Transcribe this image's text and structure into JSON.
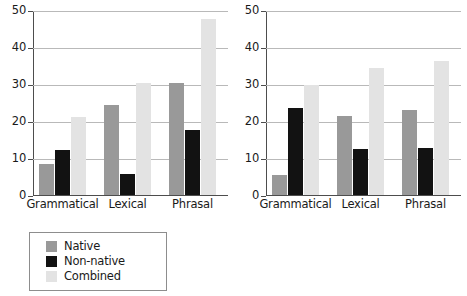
{
  "chart_data": [
    {
      "panel": "left",
      "type": "bar",
      "title": "",
      "xlabel": "",
      "ylabel": "",
      "categories": [
        "Grammatical",
        "Lexical",
        "Phrasal"
      ],
      "series": [
        {
          "name": "Native",
          "color": "#999999",
          "values": [
            8.5,
            24.3,
            30.2
          ]
        },
        {
          "name": "Non-native",
          "color": "#121212",
          "values": [
            12.1,
            5.8,
            17.5
          ]
        },
        {
          "name": "Combined",
          "color": "#e3e3e3",
          "values": [
            21.1,
            30.4,
            47.5
          ]
        }
      ],
      "ylim": [
        0,
        50
      ],
      "yticks": [
        0,
        10,
        20,
        30,
        40,
        50
      ],
      "ytick_labels": [
        "0",
        "10",
        "20",
        "30",
        "40",
        "50"
      ],
      "grid": true,
      "legend_position": "below"
    },
    {
      "panel": "right",
      "type": "bar",
      "title": "",
      "xlabel": "",
      "ylabel": "",
      "categories": [
        "Grammatical",
        "Lexical",
        "Phrasal"
      ],
      "series": [
        {
          "name": "Native",
          "color": "#999999",
          "values": [
            5.5,
            21.4,
            23.1
          ]
        },
        {
          "name": "Non-native",
          "color": "#121212",
          "values": [
            23.6,
            12.5,
            12.8
          ]
        },
        {
          "name": "Combined",
          "color": "#e3e3e3",
          "values": [
            29.7,
            34.3,
            36.1
          ]
        }
      ],
      "ylim": [
        0,
        50
      ],
      "yticks": [
        0,
        10,
        20,
        30,
        40,
        50
      ],
      "ytick_labels": [
        "0",
        "10",
        "20",
        "30",
        "40",
        "50"
      ],
      "grid": true,
      "legend_position": "below"
    }
  ],
  "legend": {
    "entries": [
      {
        "label": "Native",
        "color": "#999999"
      },
      {
        "label": "Non-native",
        "color": "#121212"
      },
      {
        "label": "Combined",
        "color": "#e3e3e3"
      }
    ]
  },
  "colors": {
    "native": "#999999",
    "non_native": "#121212",
    "combined": "#e3e3e3",
    "axis": "#4d4d4d",
    "gridline": "#b9b9b9",
    "text": "#1a1a1a",
    "background": "#ffffff",
    "legend_border": "#8d8d8d"
  }
}
